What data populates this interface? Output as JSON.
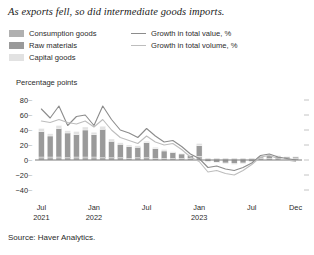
{
  "title": "As exports fell, so did intermediate goods imports.",
  "source": "Source: Haver Analytics.",
  "axis_title": "Percentage points",
  "legend": {
    "bars": [
      {
        "label": "Consumption goods",
        "color": "#b0b0b0"
      },
      {
        "label": "Raw materials",
        "color": "#9a9a9a"
      },
      {
        "label": "Capital goods",
        "color": "#e2e2e2"
      }
    ],
    "lines": [
      {
        "label": "Growth in total value, %",
        "color": "#8c8c8c"
      },
      {
        "label": "Growth in total volume, %",
        "color": "#bdbdbd"
      }
    ]
  },
  "chart_data": {
    "type": "bar",
    "title": "As exports fell, so did intermediate goods imports.",
    "xlabel": "",
    "ylabel": "Percentage points",
    "ylim": [
      -40,
      80
    ],
    "yticks": [
      80,
      60,
      40,
      20,
      0,
      -20,
      -40
    ],
    "grid": false,
    "legend_position": "top",
    "stacked": true,
    "x": [
      "Jul 2021",
      "Aug 2021",
      "Sep 2021",
      "Oct 2021",
      "Nov 2021",
      "Dec 2021",
      "Jan 2022",
      "Feb 2022",
      "Mar 2022",
      "Apr 2022",
      "May 2022",
      "Jun 2022",
      "Jul 2022",
      "Aug 2022",
      "Sep 2022",
      "Oct 2022",
      "Nov 2022",
      "Dec 2022",
      "Jan 2023",
      "Feb 2023",
      "Mar 2023",
      "Apr 2023",
      "May 2023",
      "Jun 2023",
      "Jul 2023",
      "Aug 2023",
      "Sep 2023",
      "Oct 2023",
      "Nov 2023",
      "Dec 2023"
    ],
    "xtick_labels": [
      {
        "label": "Jul",
        "year": "2021",
        "index": 0
      },
      {
        "label": "Jan",
        "year": "2022",
        "index": 6
      },
      {
        "label": "Jul",
        "year": "",
        "index": 12
      },
      {
        "label": "Jan",
        "year": "2023",
        "index": 18
      },
      {
        "label": "Jul",
        "year": "",
        "index": 24
      },
      {
        "label": "Dec",
        "year": "",
        "index": 29
      }
    ],
    "series": [
      {
        "name": "Consumption goods",
        "type": "bar",
        "color": "#b0b0b0",
        "values": [
          4,
          4,
          4,
          3,
          4,
          4,
          4,
          3,
          3,
          3,
          2,
          3,
          3,
          2,
          2,
          2,
          2,
          2,
          5,
          2,
          2,
          2,
          2,
          2,
          2,
          2,
          2,
          2,
          2,
          2
        ]
      },
      {
        "name": "Raw materials",
        "type": "bar",
        "color": "#9a9a9a",
        "values": [
          34,
          28,
          38,
          33,
          30,
          36,
          30,
          38,
          22,
          18,
          16,
          14,
          20,
          13,
          10,
          8,
          6,
          4,
          14,
          -2,
          -3,
          -4,
          -5,
          -4,
          -2,
          2,
          4,
          3,
          2,
          2
        ]
      },
      {
        "name": "Capital goods",
        "type": "bar",
        "color": "#e2e2e2",
        "values": [
          4,
          3,
          4,
          3,
          4,
          4,
          3,
          4,
          3,
          2,
          2,
          2,
          2,
          2,
          2,
          1,
          1,
          1,
          3,
          -1,
          -1,
          -1,
          -1,
          -1,
          -1,
          1,
          1,
          1,
          1,
          1
        ]
      },
      {
        "name": "Growth in total value, %",
        "type": "line",
        "color": "#8c8c8c",
        "values": [
          68,
          56,
          72,
          46,
          58,
          60,
          46,
          72,
          54,
          40,
          36,
          30,
          42,
          32,
          24,
          26,
          18,
          8,
          2,
          -10,
          -8,
          -12,
          -14,
          -10,
          -4,
          6,
          8,
          4,
          2,
          0
        ]
      },
      {
        "name": "Growth in total volume, %",
        "type": "line",
        "color": "#bdbdbd",
        "values": [
          52,
          50,
          54,
          50,
          48,
          52,
          44,
          54,
          40,
          30,
          26,
          22,
          32,
          24,
          20,
          22,
          14,
          4,
          -2,
          -16,
          -14,
          -18,
          -20,
          -14,
          -6,
          4,
          6,
          2,
          0,
          -2
        ]
      }
    ]
  }
}
